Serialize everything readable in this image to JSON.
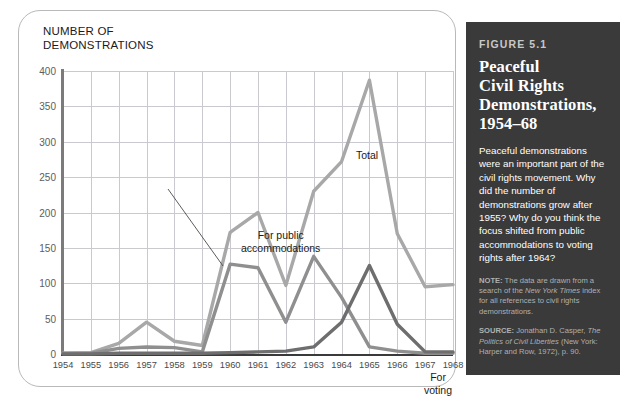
{
  "chart_card": {
    "axis_title": "NUMBER OF\nDEMONSTRATIONS"
  },
  "figure": {
    "number": "FIGURE 5.1",
    "title": "Peaceful\nCivil Rights\nDemonstrations,\n1954–68",
    "body": "Peaceful demonstrations were an important part of the civil rights movement. Why did the number of demonstrations grow after 1955? Why do you think the focus shifted from public accommodations to voting rights after 1964?",
    "note_label": "NOTE:",
    "note_text_1": " The data are drawn from a search of the ",
    "note_italic": "New York Times",
    "note_text_2": " index for all references to civil rights demonstrations.",
    "source_label": "SOURCE:",
    "source_text_1": " Jonathan D. Casper, ",
    "source_italic_1": "The Politics of Civil Liberties",
    "source_text_2": " (New York: Harper and Row, 1972), p. 90."
  },
  "colors": {
    "total": "#a8a8a8",
    "public_accommodations": "#8f8f8f",
    "voting": "#6e6e6e",
    "panel_bg": "#3a3a3a",
    "grid": "#c9c9cf"
  },
  "chart_data": {
    "type": "line",
    "xlabel": "",
    "ylabel": "NUMBER OF DEMONSTRATIONS",
    "xlim": [
      1954,
      1968
    ],
    "ylim": [
      0,
      400
    ],
    "ytick_step": 50,
    "grid": true,
    "legend": "inline-annotations",
    "categories": [
      1954,
      1955,
      1956,
      1957,
      1958,
      1959,
      1960,
      1961,
      1962,
      1963,
      1964,
      1965,
      1966,
      1967,
      1968
    ],
    "xtick_labels": [
      "1954",
      "1955",
      "1956",
      "1957",
      "1958",
      "1959",
      "1960",
      "1961",
      "1962",
      "1963",
      "1964",
      "1965",
      "1966",
      "1967",
      "1968"
    ],
    "ytick_labels": [
      "0",
      "50",
      "100",
      "150",
      "200",
      "250",
      "300",
      "350",
      "400"
    ],
    "series": [
      {
        "name": "Total",
        "color": "#a8a8a8",
        "label": "Total",
        "values": [
          1,
          2,
          15,
          45,
          18,
          12,
          172,
          200,
          97,
          230,
          272,
          387,
          170,
          95,
          98
        ]
      },
      {
        "name": "For public accommodations",
        "color": "#8f8f8f",
        "label": "For public\naccommodations",
        "values": [
          1,
          1,
          8,
          10,
          9,
          3,
          127,
          122,
          45,
          138,
          80,
          10,
          4,
          1,
          1
        ]
      },
      {
        "name": "For voting",
        "color": "#6e6e6e",
        "label": "For voting",
        "values": [
          0,
          0,
          1,
          1,
          1,
          1,
          2,
          3,
          4,
          10,
          45,
          125,
          42,
          3,
          3
        ]
      }
    ],
    "annotations": [
      {
        "text": "Total",
        "x": 1964.0,
        "y": 375
      },
      {
        "text": "For public accommodations",
        "x": 1960.3,
        "y": 255,
        "leader_line": true
      },
      {
        "text": "For voting",
        "x": 1966.6,
        "y": 72
      }
    ]
  }
}
